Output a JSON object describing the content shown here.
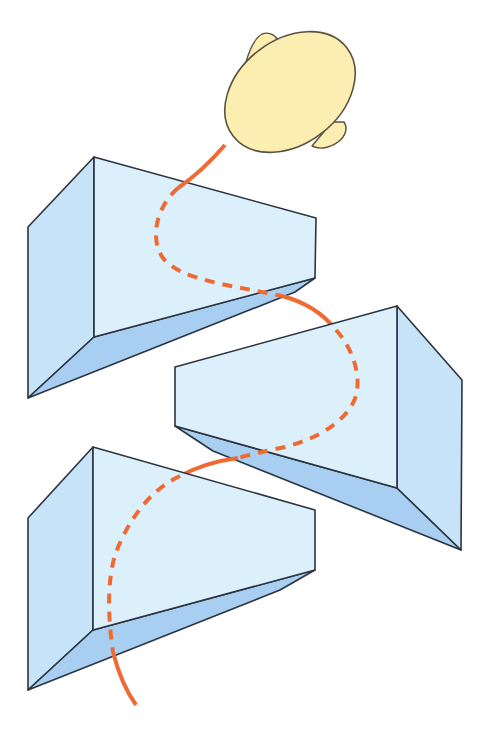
{
  "diagram": {
    "title": "",
    "colors": {
      "background": "#ffffff",
      "face_light": "#dcf0fb",
      "face_mid": "#c6e3f7",
      "face_dark": "#a8cff1",
      "edge": "#2b3440",
      "head_fill": "#fbeeb0",
      "head_stroke": "#5a5140",
      "path": "#ef6a33"
    },
    "elements": {
      "head": {
        "label": ""
      },
      "blocks": [
        {
          "id": "top-block",
          "label": ""
        },
        {
          "id": "middle-block",
          "label": ""
        },
        {
          "id": "bottom-block",
          "label": ""
        }
      ],
      "path": {
        "visible_segments": "solid",
        "hidden_segments": "dashed"
      }
    }
  }
}
